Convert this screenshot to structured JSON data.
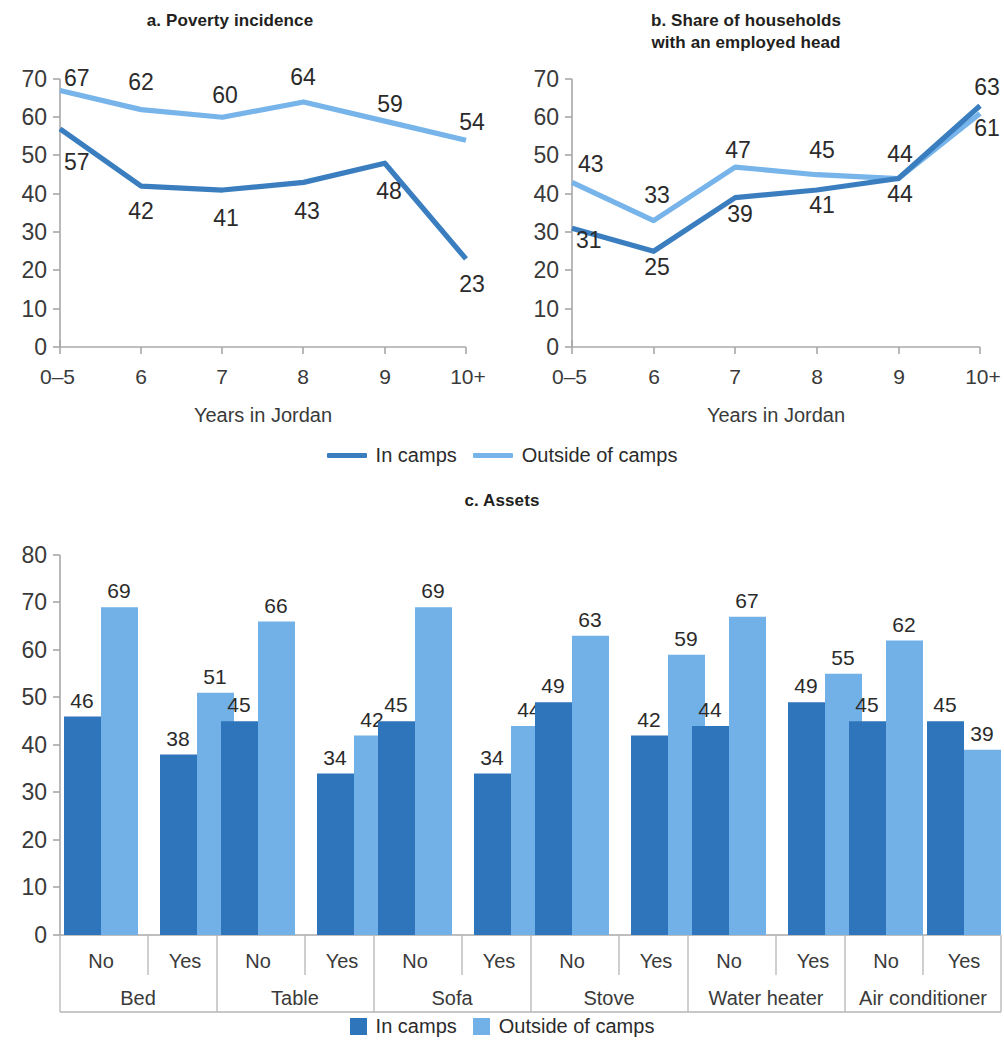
{
  "figure": {
    "legend_line": {
      "entries": [
        {
          "label": "In camps",
          "color": "#3a7ebf",
          "marker": "line"
        },
        {
          "label": "Outside of camps",
          "color": "#77b4ea",
          "marker": "line"
        }
      ]
    },
    "legend_bar": {
      "entries": [
        {
          "label": "In camps",
          "color": "#2e75bc",
          "marker": "square"
        },
        {
          "label": "Outside of camps",
          "color": "#72b0e8",
          "marker": "square"
        }
      ]
    }
  },
  "colors": {
    "in_camps_line": "#3a7ebf",
    "outside_line": "#77b4ea",
    "in_camps_bar": "#2e75bc",
    "outside_bar": "#72b0e8",
    "axis": "#a8a8a8",
    "text": "#231f20"
  },
  "chart_data": [
    {
      "id": "a",
      "type": "line",
      "title": "a. Poverty incidence",
      "xlabel": "Years in Jordan",
      "ylabel": "",
      "categories": [
        "0–5",
        "6",
        "7",
        "8",
        "9",
        "10+"
      ],
      "ylim": [
        0,
        70
      ],
      "yticks": [
        0,
        10,
        20,
        30,
        40,
        50,
        60,
        70
      ],
      "grid": false,
      "legend_position": "bottom-shared",
      "series": [
        {
          "name": "In camps",
          "color": "#3a7ebf",
          "values": [
            57,
            42,
            41,
            43,
            48,
            23
          ]
        },
        {
          "name": "Outside of camps",
          "color": "#77b4ea",
          "values": [
            67,
            62,
            60,
            64,
            59,
            54
          ]
        }
      ]
    },
    {
      "id": "b",
      "type": "line",
      "title": "b. Share of households\nwith an employed head",
      "title_line1": "b. Share of households",
      "title_line2": "with an employed head",
      "xlabel": "Years in Jordan",
      "ylabel": "",
      "categories": [
        "0–5",
        "6",
        "7",
        "8",
        "9",
        "10+"
      ],
      "ylim": [
        0,
        70
      ],
      "yticks": [
        0,
        10,
        20,
        30,
        40,
        50,
        60,
        70
      ],
      "grid": false,
      "legend_position": "bottom-shared",
      "series": [
        {
          "name": "In camps",
          "color": "#3a7ebf",
          "values": [
            31,
            25,
            39,
            41,
            44,
            63
          ]
        },
        {
          "name": "Outside of camps",
          "color": "#77b4ea",
          "values": [
            43,
            33,
            47,
            45,
            44,
            61
          ]
        }
      ]
    },
    {
      "id": "c",
      "type": "bar",
      "title": "c. Assets",
      "xlabel": "",
      "ylabel": "",
      "ylim": [
        0,
        80
      ],
      "yticks": [
        0,
        10,
        20,
        30,
        40,
        50,
        60,
        70,
        80
      ],
      "grid": false,
      "legend_position": "bottom",
      "groups": [
        "Bed",
        "Table",
        "Sofa",
        "Stove",
        "Water heater",
        "Air conditioner"
      ],
      "subcategories": [
        "No",
        "Yes"
      ],
      "categories": [
        "Bed / No",
        "Bed / Yes",
        "Table / No",
        "Table / Yes",
        "Sofa / No",
        "Sofa / Yes",
        "Stove / No",
        "Stove / Yes",
        "Water heater / No",
        "Water heater / Yes",
        "Air conditioner / No",
        "Air conditioner / Yes"
      ],
      "series": [
        {
          "name": "In camps",
          "color": "#2e75bc",
          "values": [
            46,
            38,
            45,
            34,
            45,
            34,
            49,
            42,
            44,
            49,
            45,
            45
          ]
        },
        {
          "name": "Outside of camps",
          "color": "#72b0e8",
          "values": [
            69,
            51,
            66,
            42,
            69,
            44,
            63,
            59,
            67,
            55,
            62,
            39
          ]
        }
      ]
    }
  ]
}
